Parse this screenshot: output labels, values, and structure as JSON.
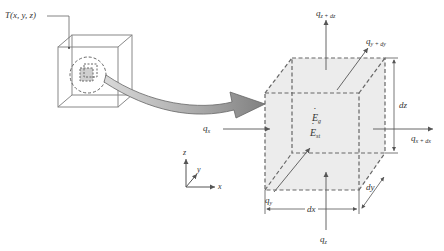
{
  "figure": {
    "point_label": "T(x, y, z)",
    "coordinate_axes": {
      "z": "z",
      "y": "y",
      "x": "x"
    },
    "heat_flows": {
      "q_x": {
        "base": "q",
        "sub": "x"
      },
      "q_x_dx": {
        "base": "q",
        "sub": "x + dx"
      },
      "q_y": {
        "base": "q",
        "sub": "y"
      },
      "q_y_dy": {
        "base": "q",
        "sub": "y + dy"
      },
      "q_z": {
        "base": "q",
        "sub": "z"
      },
      "q_z_dz": {
        "base": "q",
        "sub": "z + dz"
      }
    },
    "energy_terms": {
      "E_g": {
        "base": "E",
        "sub": "g"
      },
      "E_st": {
        "base": "E",
        "sub": "st"
      }
    },
    "dimensions": {
      "dx": "dx",
      "dy": "dy",
      "dz": "dz"
    },
    "colors": {
      "line": "#555555",
      "cube_fill": "#ececec",
      "arrow_dark": "#777777",
      "arrow_light": "#d8d8d8"
    }
  }
}
